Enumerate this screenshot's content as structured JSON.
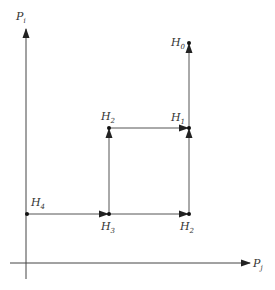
{
  "diagram": {
    "axes": {
      "y_label": {
        "main": "P",
        "sub": "i"
      },
      "x_label": {
        "main": "P",
        "sub": "j"
      }
    },
    "nodes": [
      {
        "id": "H0",
        "main": "H",
        "sub": "0",
        "x": 189,
        "y": 43
      },
      {
        "id": "H1",
        "main": "H",
        "sub": "1",
        "x": 189,
        "y": 128
      },
      {
        "id": "H2_top",
        "main": "H",
        "sub": "2",
        "x": 109,
        "y": 128
      },
      {
        "id": "H2_bottom",
        "main": "H",
        "sub": "2",
        "x": 189,
        "y": 214
      },
      {
        "id": "H3",
        "main": "H",
        "sub": "3",
        "x": 109,
        "y": 214
      },
      {
        "id": "H4",
        "main": "H",
        "sub": "4",
        "x": 27,
        "y": 214
      }
    ],
    "edges": [
      {
        "from": "H4",
        "to": "H3",
        "direction": "right"
      },
      {
        "from": "H3",
        "to": "H2_bottom",
        "direction": "right"
      },
      {
        "from": "H3",
        "to": "H2_top",
        "direction": "up"
      },
      {
        "from": "H2_top",
        "to": "H1",
        "direction": "right"
      },
      {
        "from": "H2_bottom",
        "to": "H1",
        "direction": "up"
      },
      {
        "from": "H1",
        "to": "H0",
        "direction": "up"
      }
    ]
  }
}
